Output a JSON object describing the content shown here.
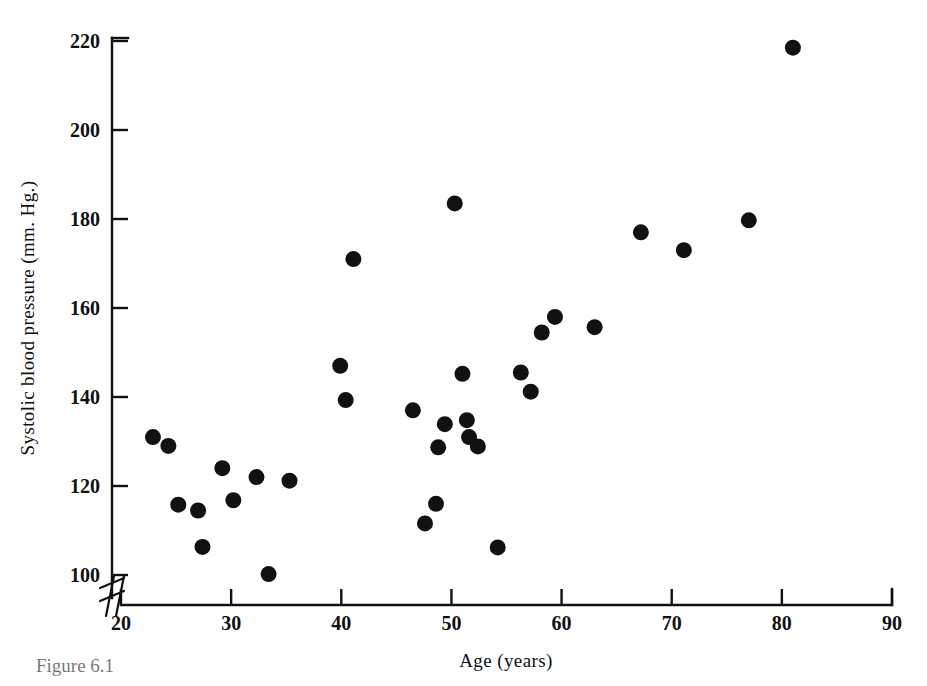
{
  "figure": {
    "caption": "Figure 6.1",
    "background_color": "#ffffff",
    "ink_color": "#111111"
  },
  "chart_data": {
    "type": "scatter",
    "title": "",
    "xlabel": "Age (years)",
    "ylabel": "Systolic blood pressure (mm. Hg.)",
    "xlim": [
      20,
      90
    ],
    "ylim": [
      95,
      224
    ],
    "xticks": [
      20,
      30,
      40,
      50,
      60,
      70,
      80,
      90
    ],
    "yticks": [
      100,
      120,
      140,
      160,
      180,
      200,
      220
    ],
    "xtick_labels": [
      "20",
      "30",
      "40",
      "50",
      "60",
      "70",
      "80",
      "90"
    ],
    "ytick_labels": [
      "100",
      "120",
      "140",
      "160",
      "180",
      "200",
      "220"
    ],
    "grid": false,
    "legend": false,
    "axis_break": {
      "present": true,
      "axis": "both-origin",
      "note": "double slash break mark at the origin corner between the y-axis base and the 20 tick"
    },
    "marker": {
      "shape": "circle",
      "color": "#111111",
      "radius_px": 8
    },
    "n_points": 32,
    "points": [
      {
        "age": 22.9,
        "bp": 131.0
      },
      {
        "age": 24.3,
        "bp": 129.0
      },
      {
        "age": 25.2,
        "bp": 115.8
      },
      {
        "age": 27.0,
        "bp": 114.5
      },
      {
        "age": 27.4,
        "bp": 106.3
      },
      {
        "age": 29.2,
        "bp": 124.0
      },
      {
        "age": 30.2,
        "bp": 116.8
      },
      {
        "age": 32.3,
        "bp": 122.0
      },
      {
        "age": 33.4,
        "bp": 100.2
      },
      {
        "age": 35.3,
        "bp": 121.2
      },
      {
        "age": 39.9,
        "bp": 147.0
      },
      {
        "age": 40.4,
        "bp": 139.3
      },
      {
        "age": 41.1,
        "bp": 171.0
      },
      {
        "age": 46.5,
        "bp": 137.0
      },
      {
        "age": 47.6,
        "bp": 111.6
      },
      {
        "age": 48.6,
        "bp": 116.0
      },
      {
        "age": 48.8,
        "bp": 128.7
      },
      {
        "age": 49.4,
        "bp": 133.9
      },
      {
        "age": 50.3,
        "bp": 183.5
      },
      {
        "age": 51.0,
        "bp": 145.2
      },
      {
        "age": 51.4,
        "bp": 134.8
      },
      {
        "age": 51.6,
        "bp": 131.0
      },
      {
        "age": 52.4,
        "bp": 128.9
      },
      {
        "age": 54.2,
        "bp": 106.2
      },
      {
        "age": 56.3,
        "bp": 145.5
      },
      {
        "age": 57.2,
        "bp": 141.2
      },
      {
        "age": 58.2,
        "bp": 154.5
      },
      {
        "age": 59.4,
        "bp": 158.0
      },
      {
        "age": 63.0,
        "bp": 155.7
      },
      {
        "age": 67.2,
        "bp": 177.0
      },
      {
        "age": 71.1,
        "bp": 173.0
      },
      {
        "age": 77.0,
        "bp": 179.7
      },
      {
        "age": 81.0,
        "bp": 218.5
      }
    ]
  }
}
